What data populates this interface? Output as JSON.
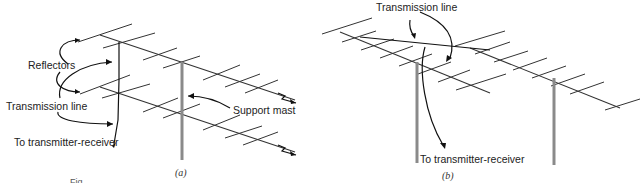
{
  "figure": {
    "panel_a": {
      "caption": "(a)",
      "labels": {
        "reflectors": "Reflectors",
        "transmission_line": "Transmission line",
        "to_transmitter": "To transmitter-receiver",
        "support_mast": "Support mast"
      }
    },
    "panel_b": {
      "caption": "(b)",
      "labels": {
        "transmission_line": "Transmission line",
        "to_transmitter": "To transmitter-receiver"
      }
    },
    "footer_caption_partial": "Fig."
  }
}
